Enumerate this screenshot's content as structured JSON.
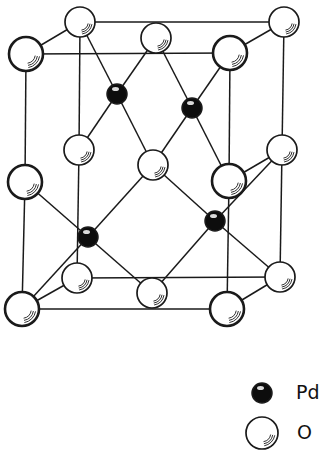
{
  "colors": {
    "line": "#1a1a1a",
    "pd_fill": "#0d0d0d",
    "o_fill": "#ffffff",
    "background": "#ffffff"
  },
  "atoms": [
    {
      "id": "o_tbl",
      "el": "O",
      "x": 80,
      "y": 22,
      "r": 15,
      "front": false
    },
    {
      "id": "o_tbr",
      "el": "O",
      "x": 284,
      "y": 22,
      "r": 15,
      "front": false
    },
    {
      "id": "o_tm",
      "el": "O",
      "x": 156,
      "y": 38,
      "r": 15,
      "front": false
    },
    {
      "id": "o_tfl",
      "el": "O",
      "x": 26,
      "y": 54,
      "r": 17,
      "front": true
    },
    {
      "id": "o_tfr",
      "el": "O",
      "x": 230,
      "y": 53,
      "r": 17,
      "front": true
    },
    {
      "id": "o_mbl",
      "el": "O",
      "x": 79,
      "y": 150,
      "r": 15,
      "front": false
    },
    {
      "id": "o_mbr",
      "el": "O",
      "x": 282,
      "y": 150,
      "r": 15,
      "front": false
    },
    {
      "id": "o_c",
      "el": "O",
      "x": 153,
      "y": 165,
      "r": 15,
      "front": false
    },
    {
      "id": "o_mfl",
      "el": "O",
      "x": 25,
      "y": 182,
      "r": 17,
      "front": true
    },
    {
      "id": "o_mfr",
      "el": "O",
      "x": 229,
      "y": 181,
      "r": 17,
      "front": true
    },
    {
      "id": "o_bbl",
      "el": "O",
      "x": 77,
      "y": 278,
      "r": 15,
      "front": false
    },
    {
      "id": "o_bbr",
      "el": "O",
      "x": 280,
      "y": 277,
      "r": 15,
      "front": false
    },
    {
      "id": "o_bm",
      "el": "O",
      "x": 152,
      "y": 293,
      "r": 15,
      "front": false
    },
    {
      "id": "o_bfl",
      "el": "O",
      "x": 22,
      "y": 309,
      "r": 17,
      "front": true
    },
    {
      "id": "o_bfr",
      "el": "O",
      "x": 227,
      "y": 309,
      "r": 17,
      "front": true
    },
    {
      "id": "pd1",
      "el": "Pd",
      "x": 117,
      "y": 94,
      "r": 10
    },
    {
      "id": "pd2",
      "el": "Pd",
      "x": 192,
      "y": 108,
      "r": 10
    },
    {
      "id": "pd3",
      "el": "Pd",
      "x": 88,
      "y": 237,
      "r": 10
    },
    {
      "id": "pd4",
      "el": "Pd",
      "x": 215,
      "y": 221,
      "r": 10
    }
  ],
  "bonds": [
    [
      "o_tbl",
      "o_tbr"
    ],
    [
      "o_tfl",
      "o_tfr"
    ],
    [
      "o_tbl",
      "o_tfl"
    ],
    [
      "o_tbr",
      "o_tfr"
    ],
    [
      "o_bbl",
      "o_bbr"
    ],
    [
      "o_bfl",
      "o_bfr"
    ],
    [
      "o_bbl",
      "o_bfl"
    ],
    [
      "o_bbr",
      "o_bfr"
    ],
    [
      "o_tfl",
      "o_mfl"
    ],
    [
      "o_mfl",
      "o_bfl"
    ],
    [
      "o_tfr",
      "o_mfr"
    ],
    [
      "o_mfr",
      "o_bfr"
    ],
    [
      "o_tbl",
      "o_mbl"
    ],
    [
      "o_mbl",
      "o_bbl"
    ],
    [
      "o_tbr",
      "o_mbr"
    ],
    [
      "o_mbr",
      "o_bbr"
    ],
    [
      "pd1",
      "o_tbl"
    ],
    [
      "pd1",
      "o_tm"
    ],
    [
      "pd1",
      "o_mbl"
    ],
    [
      "pd1",
      "o_c"
    ],
    [
      "pd2",
      "o_tm"
    ],
    [
      "pd2",
      "o_tfr"
    ],
    [
      "pd2",
      "o_c"
    ],
    [
      "pd2",
      "o_mfr"
    ],
    [
      "pd3",
      "o_mfl"
    ],
    [
      "pd3",
      "o_c"
    ],
    [
      "pd3",
      "o_bfl"
    ],
    [
      "pd3",
      "o_bm"
    ],
    [
      "pd4",
      "o_c"
    ],
    [
      "pd4",
      "o_mbr"
    ],
    [
      "pd4",
      "o_bm"
    ],
    [
      "pd4",
      "o_bbr"
    ],
    [
      "o_mbr",
      "o_mfr"
    ]
  ],
  "legend": [
    {
      "el": "Pd",
      "label": "Pd",
      "x": 262,
      "y": 393,
      "r": 10,
      "label_x": 296,
      "label_y": 381
    },
    {
      "el": "O",
      "label": "O",
      "x": 262,
      "y": 433,
      "r": 16,
      "label_x": 297,
      "label_y": 421
    }
  ]
}
